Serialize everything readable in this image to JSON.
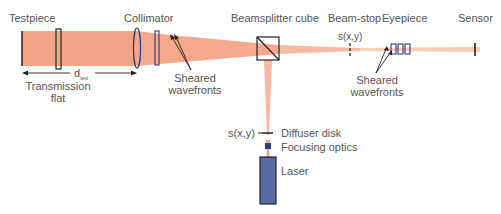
{
  "labels": {
    "testpiece": "Testpiece",
    "collimator": "Collimator",
    "beamsplitter": "Beamsplitter cube",
    "beamstop": "Beam-stop",
    "eyepiece": "Eyepiece",
    "sensor": "Sensor",
    "transmission_flat_1": "Transmission",
    "transmission_flat_2": "flat",
    "dtest": "d",
    "dtest_sub": "test",
    "sheared1_1": "Sheared",
    "sheared1_2": "wavefronts",
    "sheared2_1": "Sheared",
    "sheared2_2": "wavefronts",
    "sxy_top": "s(x,y)",
    "sxy_bottom": "s(x,y)",
    "diffuser": "Diffuser disk",
    "focusing": "Focusing optics",
    "laser": "Laser"
  },
  "colors": {
    "beam": "#f4a487",
    "beam_light": "#f9cdb8",
    "optic_outline": "#2b3a7a",
    "laser_fill": "#5b6a9e",
    "focusing_fill": "#2b3f7a",
    "text": "#555555"
  }
}
